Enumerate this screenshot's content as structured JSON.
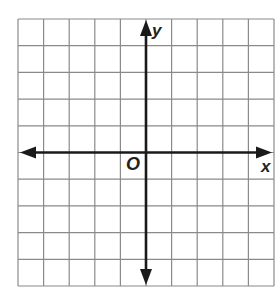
{
  "diagram": {
    "type": "coordinate-plane",
    "grid": {
      "columns": 10,
      "rows": 10,
      "left": 18,
      "top": 19,
      "right": 274,
      "bottom": 286,
      "line_color": "#8a8a8a"
    },
    "axes": {
      "color": "#1a1a1a",
      "x_axis_row": 5,
      "y_axis_col": 5
    },
    "labels": {
      "x_axis": "x",
      "y_axis": "y",
      "origin": "O"
    }
  }
}
